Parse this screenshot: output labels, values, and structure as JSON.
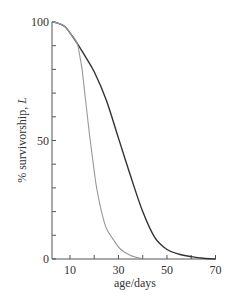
{
  "chart_data": {
    "type": "line",
    "title": "",
    "xlabel": "age/days",
    "ylabel": "% survivorship, L",
    "ylabel_italic_part": "L",
    "xlim": [
      2.6,
      70
    ],
    "ylim": [
      0,
      100
    ],
    "x_tick_labels": [
      "10",
      "30",
      "50",
      "70"
    ],
    "x_tick_values": [
      10,
      20,
      30,
      40,
      50,
      60,
      70
    ],
    "y_tick_labels": [
      "0",
      "50",
      "100"
    ],
    "y_tick_values": [
      0,
      10,
      20,
      30,
      40,
      50,
      60,
      70,
      80,
      90,
      100
    ],
    "grid": false,
    "legend": null,
    "series": [
      {
        "name": "dark curve",
        "color": "#333333",
        "x": [
          2.6,
          5,
          8,
          11,
          13,
          16,
          20,
          25,
          30,
          35,
          40,
          45,
          50,
          55,
          60,
          65,
          70
        ],
        "values": [
          100,
          99.5,
          98,
          94,
          91,
          86,
          79,
          67,
          51,
          35,
          20,
          9,
          4,
          2,
          1,
          0.3,
          0
        ]
      },
      {
        "name": "light curve",
        "color": "#999999",
        "x": [
          2.6,
          5,
          8,
          11,
          13,
          14,
          15,
          16,
          17,
          18,
          19,
          20,
          21,
          23,
          25,
          28,
          31,
          35,
          40
        ],
        "values": [
          100,
          99.5,
          98,
          94,
          91,
          86,
          80,
          71,
          62,
          53,
          45,
          37,
          30,
          20,
          13,
          8,
          4,
          1.5,
          0
        ]
      }
    ]
  },
  "axes": {
    "x_title": "age/days",
    "y_title_prefix": "% survivorship, ",
    "y_title_italic": "L"
  }
}
